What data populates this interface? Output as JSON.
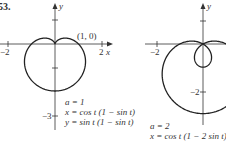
{
  "figure": {
    "problem_number": "53.",
    "left_panel": {
      "point_label": "(1, 0)",
      "x_tick_neg": "−2",
      "x_tick_pos": "2",
      "x_axis_label": "x",
      "y_axis_label": "y",
      "y_tick_neg": "−3",
      "caption_a": "a = 1",
      "caption_x": "x = cos t (1 − sin t)",
      "caption_y": "y = sin t (1 − sin t)"
    },
    "right_panel": {
      "x_tick_neg": "−2",
      "y_axis_label": "y",
      "y_tick_neg": "−2",
      "caption_a": "a = 2",
      "caption_x": "x = cos t (1 − 2 sin t)"
    }
  },
  "chart_data": [
    {
      "type": "line",
      "title": "a = 1",
      "xlabel": "x",
      "ylabel": "y",
      "parametric": {
        "x": "cos t (1 − sin t)",
        "y": "sin t (1 − sin t)",
        "t_range": [
          0,
          6.2832
        ]
      },
      "annotations": [
        {
          "text": "(1, 0)",
          "x": 1,
          "y": 0
        }
      ],
      "x_ticks": [
        -2,
        2
      ],
      "y_ticks": [
        1,
        -1,
        -3
      ],
      "xlim": [
        -2.3,
        2.3
      ],
      "ylim": [
        -3.2,
        1.6
      ],
      "grid": false
    },
    {
      "type": "line",
      "title": "a = 2",
      "xlabel": "x",
      "ylabel": "y",
      "parametric": {
        "x": "cos t (1 − 2 sin t)",
        "y": "sin t (1 − 2 sin t)",
        "t_range": [
          0,
          6.2832
        ]
      },
      "x_ticks": [
        -2
      ],
      "y_ticks": [
        1,
        -2
      ],
      "xlim": [
        -2.3,
        1.0
      ],
      "ylim": [
        -3.3,
        1.6
      ],
      "grid": false
    }
  ]
}
